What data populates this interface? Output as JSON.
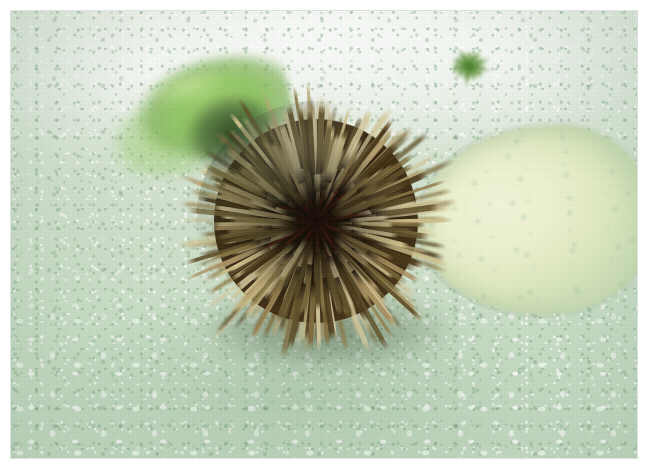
{
  "image": {
    "kind": "photograph",
    "subject_label": "sea urchin",
    "scene_label": "underwater sandy seabed",
    "alt_text": "Underwater photograph of a sea urchin with long tan spines resting on pale green gravelly sand, a white shell to its right and green algae-covered rock to its left",
    "orientation": "landscape",
    "border_label": "white photo border",
    "frame": {
      "x": 11,
      "y": 11,
      "width": 626,
      "height": 447
    },
    "canvas": {
      "width": 648,
      "height": 470
    }
  },
  "palette": {
    "photo_border": "#ffffff",
    "sand_light": "#e3ecdf",
    "sand_mid": "#cfe0cb",
    "sand_deep": "#c6dbc4",
    "sand_pebble_white": "#ffffff",
    "sand_fleck_green": "#76a076",
    "algae_bright_green": "#8cc45c",
    "algae_highlight": "#c4e496",
    "algae_dark": "#263e20",
    "tuft_green": "#568c34",
    "shell_cream": "#f2f5d8",
    "shell_shadow": "#cfe0b8",
    "spine_pale": "#cfc08c",
    "spine_tan": "#a89060",
    "spine_olive": "#7d6a3c",
    "spine_dark": "#4a3718",
    "urchin_core": "#130d08",
    "urchin_red": "#9c2a1a",
    "urchin_shadow": "#2c4228"
  },
  "objects": [
    {
      "id": "urchin",
      "name": "sea urchin",
      "description": "Globular sea urchin with dense radiating tan and olive spines over a dark brown-black test, reddish streaks visible at the centre",
      "center": {
        "x": 305,
        "y": 212
      },
      "radius": 102,
      "spine_length_px": 78
    },
    {
      "id": "white-shell",
      "name": "white shell",
      "description": "Large pale cream-yellow shell or stone lying on the sand to the right of the urchin",
      "center": {
        "x": 526,
        "y": 210
      },
      "width": 236,
      "height": 188
    },
    {
      "id": "algae-rock",
      "name": "green algae rock",
      "description": "Bright green algae-covered rock or shell in the upper left with a dark shaded side",
      "center": {
        "x": 187,
        "y": 105
      },
      "width": 190,
      "height": 122
    },
    {
      "id": "algae-tuft",
      "name": "algae tuft",
      "description": "Small dark green tuft of algae on the sand in the upper right",
      "center": {
        "x": 458,
        "y": 55
      },
      "width": 52,
      "height": 46
    },
    {
      "id": "seabed",
      "name": "sandy seabed",
      "description": "Coarse pale green-white gravelly sand covering the whole frame, hazier and lighter toward the top"
    }
  ],
  "spines": {
    "count_back": 150,
    "count_mid": 132,
    "count_front": 96
  }
}
